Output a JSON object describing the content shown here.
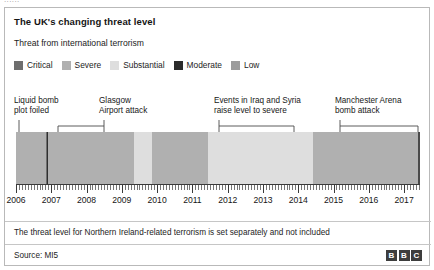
{
  "top_sliver_text": "......",
  "card": {
    "title": "The UK's changing threat level",
    "subtitle": "Threat from international terrorism",
    "footnote": "The threat level for Northern Ireland-related terrorism is set separately and not included",
    "source": "Source: MI5"
  },
  "legend": {
    "items": [
      {
        "label": "Critical",
        "color": "#6e6e6e"
      },
      {
        "label": "Severe",
        "color": "#b0b0b0"
      },
      {
        "label": "Substantial",
        "color": "#dedede"
      },
      {
        "label": "Moderate",
        "color": "#2b2b2b"
      },
      {
        "label": "Low",
        "color": "#9c9c9c"
      }
    ]
  },
  "annotations": [
    {
      "id": "liquid-bomb-plot-foiled",
      "line1": "Liquid bomb",
      "line2": "plot foiled",
      "text_x": 9,
      "text_y": 88,
      "stem_x": 14,
      "stem_top": 112,
      "stem_bottom": 124,
      "bracket": false
    },
    {
      "id": "glasgow-airport-attack",
      "line1": "Glasgow",
      "line2": "Airport attack",
      "text_x": 94,
      "text_y": 88,
      "stem_x": 99,
      "stem_top": 112,
      "stem_bottom": 124,
      "bracket": true,
      "bracket_left": 53,
      "bracket_right": 99,
      "bracket_y": 118
    },
    {
      "id": "iraq-syria-raise-to-severe",
      "line1": "Events in Iraq and Syria",
      "line2": "raise level to severe",
      "text_x": 209,
      "text_y": 88,
      "stem_x": 214,
      "stem_top": 112,
      "stem_bottom": 124,
      "bracket": true,
      "bracket_left": 214,
      "bracket_right": 289,
      "bracket_y": 118
    },
    {
      "id": "manchester-arena-bomb-attack",
      "line1": "Manchester Arena",
      "line2": "bomb attack",
      "text_x": 330,
      "text_y": 88,
      "stem_x": 335,
      "stem_top": 112,
      "stem_bottom": 124,
      "bracket": true,
      "bracket_left": 335,
      "bracket_right": 413,
      "bracket_y": 118
    }
  ],
  "chart_data": {
    "type": "bar",
    "title": "The UK's changing threat level",
    "subtitle": "Threat from international terrorism",
    "xlabel": "",
    "ylabel": "",
    "orientation": "horizontal-timeline",
    "xlim": [
      2006.0,
      2017.45
    ],
    "grid": false,
    "legend_position": "top-left",
    "tick_labels": [
      "2006",
      "2007",
      "2008",
      "2009",
      "2010",
      "2011",
      "2012",
      "2013",
      "2014",
      "2015",
      "2016",
      "2017"
    ],
    "minor_tick_interval_months": 1,
    "categories": [
      "Critical",
      "Severe",
      "Substantial",
      "Moderate",
      "Low"
    ],
    "colors": {
      "Critical": "#6e6e6e",
      "Severe": "#b0b0b0",
      "Substantial": "#dedede",
      "Moderate": "#2b2b2b",
      "Low": "#9c9c9c"
    },
    "segments": [
      {
        "level": "Severe",
        "color": "#b0b0b0",
        "start": 2006.0,
        "end": 2006.85
      },
      {
        "level": "Critical",
        "color": "#6e6e6e",
        "start": 2006.85,
        "end": 2006.92
      },
      {
        "level": "Severe",
        "color": "#b0b0b0",
        "start": 2006.92,
        "end": 2009.35
      },
      {
        "level": "Substantial",
        "color": "#dedede",
        "start": 2009.35,
        "end": 2009.85
      },
      {
        "level": "Severe",
        "color": "#b0b0b0",
        "start": 2009.85,
        "end": 2011.45
      },
      {
        "level": "Substantial",
        "color": "#dedede",
        "start": 2011.45,
        "end": 2014.42
      },
      {
        "level": "Severe",
        "color": "#b0b0b0",
        "start": 2014.42,
        "end": 2017.42
      }
    ],
    "event_markers": [
      {
        "label": "Liquid bomb plot foiled",
        "x": 2006.88
      },
      {
        "label": "Glasgow Airport attack",
        "x": 2007.5
      },
      {
        "label": "Events in Iraq and Syria raise level to severe",
        "x": 2014.42
      },
      {
        "label": "Manchester Arena bomb attack",
        "x": 2017.4
      }
    ],
    "annotations": [
      "Liquid bomb plot foiled",
      "Glasgow Airport attack",
      "Events in Iraq and Syria raise level to severe",
      "Manchester Arena bomb attack"
    ]
  },
  "bbc_logo": {
    "blocks": [
      "B",
      "B",
      "C"
    ]
  }
}
